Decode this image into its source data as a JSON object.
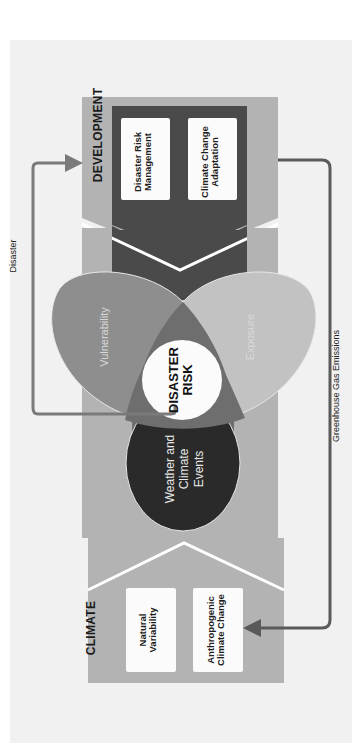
{
  "diagram": {
    "orientation": "rotated -90deg",
    "colors": {
      "background": "#ffffff",
      "panel": "#f1f1f1",
      "section_box": "#b3b3b3",
      "dev_inner": "#4a4a4a",
      "vulnerability": "#8e8e8e",
      "exposure": "#c2c2c2",
      "events": "#2a2a2a",
      "overlap": "#6e6e6e",
      "risk_circle": "#fbfbfb",
      "arrow": "#7a7a7a",
      "ghg_arrow": "#5a5a5a"
    },
    "development": {
      "title": "DEVELOPMENT",
      "boxes": [
        {
          "label": "Disaster Risk\nManagement"
        },
        {
          "label": "Climate Change\nAdaptation"
        }
      ]
    },
    "climate": {
      "title": "CLIMATE",
      "boxes": [
        {
          "label": "Natural\nVariability"
        },
        {
          "label": "Anthropogenic\nClimate Change"
        }
      ]
    },
    "venn": {
      "vulnerability": "Vulnerability",
      "exposure": "Exposure",
      "events": "Weather and\nClimate\nEvents",
      "center": "DISASTER\nRISK"
    },
    "arrows": {
      "disaster": "Disaster",
      "ghg": "Greenhouse Gas Emissions"
    }
  }
}
